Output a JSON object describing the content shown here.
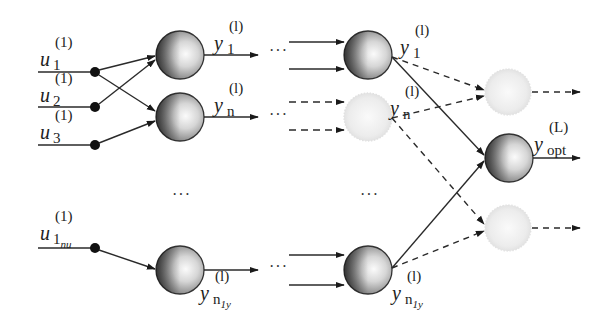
{
  "diagram": {
    "title": "",
    "inputs": [
      {
        "base": "u",
        "sub": "1",
        "sup": "(1)"
      },
      {
        "base": "u",
        "sub": "2",
        "sup": "(1)"
      },
      {
        "base": "u",
        "sub": "3",
        "sup": "(1)"
      },
      {
        "base": "u",
        "sub": "1",
        "sub_small": "nu",
        "sup": "(1)"
      }
    ],
    "layer1_outputs": [
      {
        "base": "y",
        "sub": "1",
        "sup": "(l)"
      },
      {
        "base": "y",
        "sub": "n",
        "sup": "(l)"
      },
      {
        "base": "y",
        "sub": "n",
        "sub_small": "1y",
        "sup": "(l)"
      }
    ],
    "layerl_outputs": [
      {
        "base": "y",
        "sub": "1",
        "sup": "(l)"
      },
      {
        "base": "y",
        "sub": "n",
        "sup": "(l)"
      },
      {
        "base": "y",
        "sub": "n",
        "sub_small": "1y",
        "sup": "(l)"
      }
    ],
    "final_output": {
      "base": "y",
      "sub": "opt",
      "sup": "(L)"
    },
    "ellipsis": "···",
    "colors": {
      "line": "#2a2a2a",
      "neuron_edge": "#333333",
      "neuron_dark": "#1e1e1e",
      "neuron_light": "#f4f4f4",
      "faded_neuron": "#e6e6e6"
    }
  }
}
